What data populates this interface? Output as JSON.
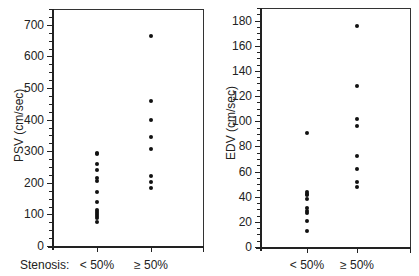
{
  "chart_data": [
    {
      "type": "scatter",
      "title": "",
      "xlabel": "Stenosis",
      "ylabel": "PSV (cm/sec)",
      "categories": [
        "< 50%",
        "≥ 50%"
      ],
      "ylim": [
        0,
        750
      ],
      "yticks": [
        0,
        100,
        200,
        300,
        400,
        500,
        600,
        700
      ],
      "grid": false,
      "series": [
        {
          "name": "< 50%",
          "values": [
            295,
            290,
            258,
            240,
            215,
            205,
            172,
            138,
            115,
            108,
            102,
            96,
            90,
            75
          ]
        },
        {
          "name": "≥ 50%",
          "values": [
            665,
            460,
            400,
            345,
            308,
            221,
            202,
            184
          ]
        }
      ]
    },
    {
      "type": "scatter",
      "title": "",
      "xlabel": "",
      "ylabel": "EDV (cm/sec)",
      "categories": [
        "< 50%",
        "≥ 50%"
      ],
      "ylim": [
        0,
        190
      ],
      "yticks": [
        0,
        20,
        40,
        60,
        80,
        100,
        120,
        140,
        160,
        180
      ],
      "grid": false,
      "series": [
        {
          "name": "< 50%",
          "values": [
            91,
            44,
            42,
            41,
            38,
            31,
            29,
            27,
            21,
            13
          ]
        },
        {
          "name": "≥ 50%",
          "values": [
            176,
            128,
            102,
            96,
            72,
            62,
            52,
            48
          ]
        }
      ]
    }
  ],
  "labels": {
    "stenosis": "Stenosis:",
    "left_ylabel": "PSV (cm/sec)",
    "right_ylabel": "EDV (cm/sec)",
    "cat1": "< 50%",
    "cat2": "≥ 50%"
  }
}
